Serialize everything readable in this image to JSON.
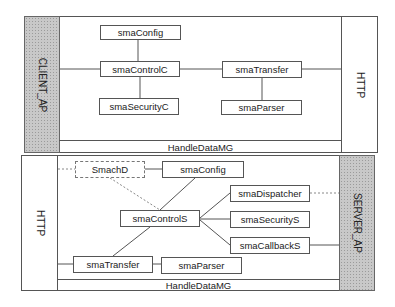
{
  "client_panel": {
    "side_label": "CLIENT_AP",
    "right_label": "HTTP",
    "bottom_bar": "HandleDataMG",
    "modules": {
      "config": "smaConfig",
      "control": "smaControlC",
      "security": "smaSecurityC",
      "transfer": "smaTransfer",
      "parser": "smaParser"
    }
  },
  "server_panel": {
    "left_label": "HTTP",
    "side_label": "SERVER_AP",
    "bottom_bar": "HandleDataMG",
    "modules": {
      "smachd": "SmachD",
      "config": "smaConfig",
      "control": "smaControlS",
      "dispatcher": "smaDispatcher",
      "security": "smaSecurityS",
      "callback": "smaCallbackS",
      "transfer": "smaTransfer",
      "parser": "smaParser"
    }
  },
  "colors": {
    "line": "#555555",
    "dashed_line": "#888888",
    "shaded": "#c8c8c8"
  }
}
